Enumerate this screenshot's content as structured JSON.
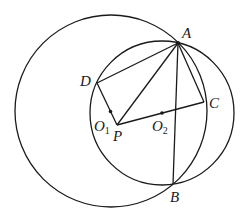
{
  "diagram": {
    "type": "geometry",
    "stroke_color": "#1a1a1a",
    "circles": [
      {
        "name": "large-circle",
        "cx": 111,
        "cy": 111,
        "r": 96
      },
      {
        "name": "circle-O2",
        "cx": 162,
        "cy": 113,
        "r": 72
      }
    ],
    "points": {
      "A": {
        "x": 178,
        "y": 43
      },
      "B": {
        "x": 173,
        "y": 184
      },
      "C": {
        "x": 204,
        "y": 102
      },
      "D": {
        "x": 97,
        "y": 83
      },
      "P": {
        "x": 117,
        "y": 125
      },
      "O1": {
        "x": 110.5,
        "y": 111.5
      },
      "O2": {
        "x": 162,
        "y": 113
      }
    },
    "labels": {
      "A": "A",
      "B": "B",
      "C": "C",
      "D": "D",
      "P": "P",
      "O1_main": "O",
      "O1_sub": "1",
      "O2_main": "O",
      "O2_sub": "2"
    },
    "segments": [
      "AD",
      "DP",
      "PA",
      "AC",
      "CP",
      "AB"
    ]
  }
}
